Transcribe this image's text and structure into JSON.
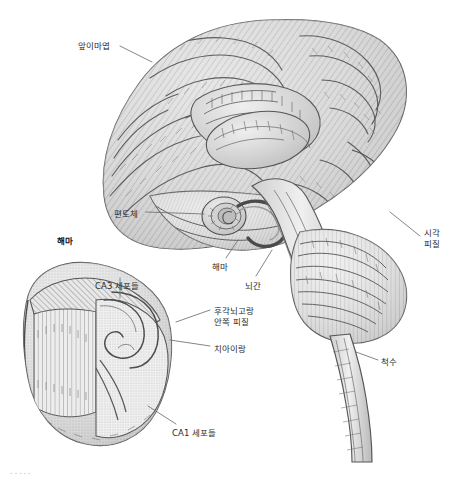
{
  "figure": {
    "title_caption": "",
    "background_color": "#ffffff",
    "ink_color": "#4a4a4a",
    "label_color": "#2b2b2b",
    "leader_color": "#6f6f6f",
    "width": 464,
    "height": 482
  },
  "labels": [
    {
      "id": "prefrontal-lobe",
      "text": "앞이마엽",
      "x": 78,
      "y": 41,
      "bold": false,
      "align": "left"
    },
    {
      "id": "amygdala",
      "text": "편도체",
      "x": 114,
      "y": 209,
      "bold": false,
      "align": "left"
    },
    {
      "id": "hippocampus-inset-title",
      "text": "해마",
      "x": 57,
      "y": 236,
      "bold": true,
      "align": "left"
    },
    {
      "id": "hippocampus",
      "text": "해마",
      "x": 212,
      "y": 262,
      "bold": false,
      "align": "left"
    },
    {
      "id": "brainstem",
      "text": "뇌간",
      "x": 245,
      "y": 281,
      "bold": false,
      "align": "left"
    },
    {
      "id": "visual-cortex",
      "text": "시각\n피질",
      "x": 424,
      "y": 228,
      "bold": false,
      "align": "left"
    },
    {
      "id": "spinal-cord",
      "text": "척수",
      "x": 381,
      "y": 357,
      "bold": false,
      "align": "left"
    },
    {
      "id": "ca3-cells",
      "text": "CA3 세포들",
      "x": 95,
      "y": 281,
      "bold": false,
      "align": "left"
    },
    {
      "id": "rhinal-sulcus-entorhinal-cortex",
      "text": "후각뇌고랑\n안쪽 피질",
      "x": 214,
      "y": 306,
      "bold": false,
      "align": "left"
    },
    {
      "id": "dentate-gyrus",
      "text": "치아이랑",
      "x": 214,
      "y": 344,
      "bold": false,
      "align": "left"
    },
    {
      "id": "ca1-cells",
      "text": "CA1 세포들",
      "x": 172,
      "y": 428,
      "bold": false,
      "align": "left"
    }
  ],
  "footer": {
    "dots": ".....",
    "x": 10,
    "y": 466
  },
  "anatomy_parts": [
    {
      "id": "cerebrum",
      "name": "대뇌"
    },
    {
      "id": "corpus-callosum",
      "name": "뇌들보"
    },
    {
      "id": "thalamus",
      "name": "시상"
    },
    {
      "id": "amygdala-body",
      "name": "편도체"
    },
    {
      "id": "hippocampus-body",
      "name": "해마"
    },
    {
      "id": "brainstem-body",
      "name": "뇌간"
    },
    {
      "id": "cerebellum",
      "name": "소뇌"
    },
    {
      "id": "spinal-cord-body",
      "name": "척수"
    },
    {
      "id": "hippocampus-inset-body",
      "name": "해마 확대도"
    }
  ]
}
